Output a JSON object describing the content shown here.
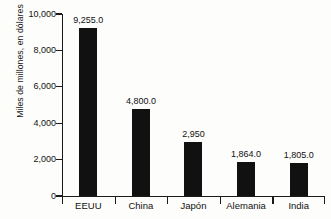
{
  "chart_data": {
    "type": "bar",
    "title": "",
    "subtitle": "",
    "xlabel": "",
    "ylabel": "Miles de millones, en dólares",
    "categories": [
      "EEUU",
      "China",
      "Japón",
      "Alemania",
      "India"
    ],
    "values": [
      9255.0,
      4800.0,
      2950,
      1864.0,
      1805.0
    ],
    "value_labels": [
      "9,255.0",
      "4,800.0",
      "2,950",
      "1,864.0",
      "1,805.0"
    ],
    "ylim": [
      0,
      10000
    ],
    "ytick_values": [
      0,
      2000,
      4000,
      6000,
      8000,
      10000
    ],
    "ytick_labels": [
      "0",
      "2,000",
      "4,000",
      "6,000",
      "8,000",
      "10,000"
    ],
    "grid": false,
    "legend": "none",
    "orientation": "vertical",
    "bar_color": "#111111",
    "background_color": "#fdfdfb",
    "axis_color": "#1a1a1a"
  }
}
